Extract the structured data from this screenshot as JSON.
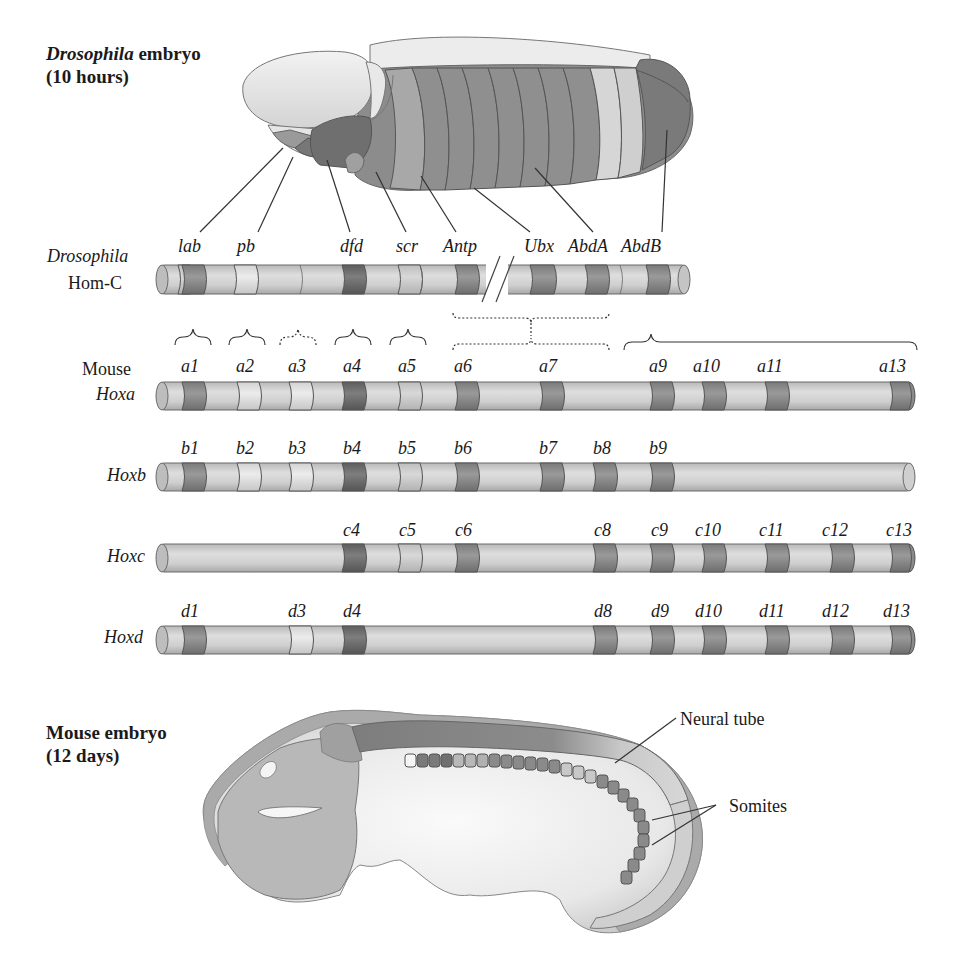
{
  "drosophila_embryo": {
    "title_italic": "Drosophila",
    "title_rest": " embryo",
    "subtitle": "(10 hours)",
    "gene_callouts": [
      "lab",
      "pb",
      "dfd",
      "scr",
      "Antp",
      "Ubx",
      "AbdA",
      "AbdB"
    ]
  },
  "homc": {
    "label_line1": "Drosophila",
    "label_line2": "Hom-C",
    "genes": [
      {
        "name": "lab",
        "x": 189,
        "shade": "dark"
      },
      {
        "name": "pb",
        "x": 247,
        "shade": "light"
      },
      {
        "name": "dfd",
        "x": 354,
        "shade": "darkest"
      },
      {
        "name": "scr",
        "x": 408,
        "shade": "mid-light"
      },
      {
        "name": "Antp",
        "x": 466,
        "shade": "dark"
      },
      {
        "name": "Ubx",
        "x": 543,
        "shade": "dark"
      },
      {
        "name": "AbdA",
        "x": 600,
        "shade": "dark"
      },
      {
        "name": "AbdB",
        "x": 659,
        "shade": "dark"
      }
    ],
    "break_marker": "//"
  },
  "homology_brackets": [
    {
      "target": "a1",
      "style": "solid"
    },
    {
      "target": "a2",
      "style": "solid"
    },
    {
      "target": "a3",
      "style": "dotted"
    },
    {
      "target": "a4",
      "style": "solid"
    },
    {
      "target": "a5",
      "style": "solid"
    },
    {
      "target": "a6-a8 / Antp-Ubx-AbdA",
      "style": "dotted"
    },
    {
      "target": "a9-a13 / AbdB",
      "style": "solid"
    }
  ],
  "mouse_clusters": {
    "species_label": "Mouse",
    "rows": [
      {
        "label": "Hoxa",
        "genes": [
          "a1",
          "a2",
          "a3",
          "a4",
          "a5",
          "a6",
          "a7",
          "a9",
          "a10",
          "a11",
          "a13"
        ]
      },
      {
        "label": "Hoxb",
        "genes": [
          "b1",
          "b2",
          "b3",
          "b4",
          "b5",
          "b6",
          "b7",
          "b8",
          "b9"
        ]
      },
      {
        "label": "Hoxc",
        "genes": [
          "c4",
          "c5",
          "c6",
          "c8",
          "c9",
          "c10",
          "c11",
          "c12",
          "c13"
        ]
      },
      {
        "label": "Hoxd",
        "genes": [
          "d1",
          "d3",
          "d4",
          "d8",
          "d9",
          "d10",
          "d11",
          "d12",
          "d13"
        ]
      }
    ],
    "paralog_x": {
      "1": 189,
      "2": 247,
      "3": 298,
      "4": 354,
      "5": 408,
      "6": 466,
      "7": 548,
      "8": 604,
      "9": 660,
      "10": 714,
      "11": 778,
      "12": 843,
      "13": 906
    }
  },
  "mouse_embryo": {
    "title": "Mouse embryo",
    "subtitle": "(12 days)",
    "callouts": [
      "Neural tube",
      "Somites"
    ]
  },
  "colors": {
    "darkest": "#6f6f6f",
    "dark": "#8a8a8a",
    "mid": "#a9a9a9",
    "mid_light": "#c4c4c4",
    "light": "#dcdcdc",
    "bar_base": "#c9c9c9",
    "outline": "#5a5a5a"
  }
}
